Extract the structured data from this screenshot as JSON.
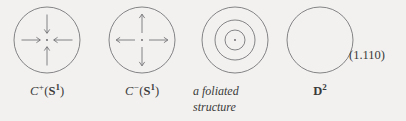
{
  "figure": {
    "equation_number": "(1.110)",
    "background_color": "#f2f1ef",
    "stroke_color": "#5f5f63",
    "items": [
      {
        "id": "c-plus-s1",
        "diagram": "circle-with-inward-arrows",
        "arrow_direction": "inward",
        "circle_radius": 33,
        "has_center_dot": true,
        "caption_main": "C",
        "caption_sup": "+",
        "caption_paren_open": "(",
        "caption_bold": "S",
        "caption_bold_sup": "1",
        "caption_paren_close": ")"
      },
      {
        "id": "c-minus-s1",
        "diagram": "circle-with-outward-arrows",
        "arrow_direction": "outward",
        "circle_radius": 33,
        "has_center_dot": true,
        "caption_main": "C",
        "caption_sup": "−",
        "caption_paren_open": "(",
        "caption_bold": "S",
        "caption_bold_sup": "1",
        "caption_paren_close": ")"
      },
      {
        "id": "foliated-structure",
        "diagram": "concentric-circles",
        "circle_radii": [
          33,
          20,
          10
        ],
        "has_center_dot": true,
        "caption_line1": "a foliated",
        "caption_line2": "structure"
      },
      {
        "id": "d-squared",
        "diagram": "plain-circle",
        "circle_radius": 33,
        "has_center_dot": false,
        "caption_bold": "D",
        "caption_bold_sup": "2"
      }
    ]
  }
}
